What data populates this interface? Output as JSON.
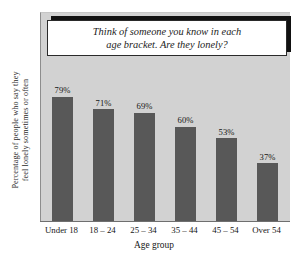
{
  "chart_data": {
    "type": "bar",
    "title": "",
    "categories": [
      "Under 18",
      "18 – 24",
      "25 – 34",
      "35 – 44",
      "45 – 54",
      "Over 54"
    ],
    "values": [
      79,
      71,
      69,
      60,
      53,
      37
    ],
    "value_labels": [
      "79%",
      "71%",
      "69%",
      "60%",
      "53%",
      "37%"
    ],
    "xlabel": "Age group",
    "ylabel_line1": "Percentage of people who say they",
    "ylabel_line2": "feel lonely sometimes or often",
    "ylim": [
      0,
      100
    ],
    "grid": false,
    "legend": "none",
    "annotation": "Think of someone you know in each\nage bracket. Are they lonely?",
    "colors": {
      "bar": "#585858",
      "plot_background": "#d2d2d2",
      "page_background": "#ffffff",
      "callout_background": "#ffffff",
      "callout_border": "#2a2a2a",
      "callout_shadow": "#111111",
      "axis_line": "#6f6f6f",
      "text": "#171717"
    }
  }
}
